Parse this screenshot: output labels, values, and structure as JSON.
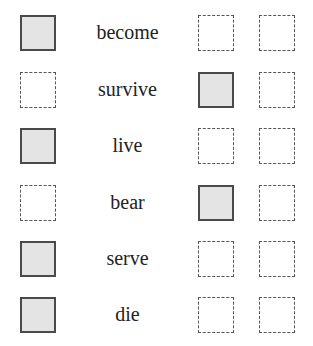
{
  "rows": [
    {
      "word": "become",
      "boxes": [
        "filled",
        "empty",
        "empty"
      ]
    },
    {
      "word": "survive",
      "boxes": [
        "empty",
        "filled",
        "empty"
      ]
    },
    {
      "word": "live",
      "boxes": [
        "filled",
        "empty",
        "empty"
      ]
    },
    {
      "word": "bear",
      "boxes": [
        "empty",
        "filled",
        "empty"
      ]
    },
    {
      "word": "serve",
      "boxes": [
        "filled",
        "empty",
        "empty"
      ]
    },
    {
      "word": "die",
      "boxes": [
        "filled",
        "empty",
        "empty"
      ]
    }
  ]
}
